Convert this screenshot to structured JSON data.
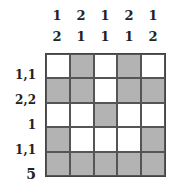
{
  "puzzle": {
    "type": "nonogram",
    "size": 5,
    "column_clues": [
      [
        "1",
        "2"
      ],
      [
        "2",
        "1"
      ],
      [
        "1",
        "1"
      ],
      [
        "2",
        "1"
      ],
      [
        "1",
        "2"
      ]
    ],
    "row_clues": [
      "1,1",
      "2,2",
      "1",
      "1,1",
      "5"
    ],
    "grid": [
      [
        0,
        1,
        0,
        1,
        0
      ],
      [
        1,
        1,
        0,
        1,
        1
      ],
      [
        0,
        0,
        1,
        0,
        0
      ],
      [
        1,
        0,
        0,
        0,
        1
      ],
      [
        1,
        1,
        1,
        1,
        1
      ]
    ],
    "colors": {
      "filled": "#b3b3b3",
      "empty": "#ffffff",
      "border": "#444444"
    }
  }
}
